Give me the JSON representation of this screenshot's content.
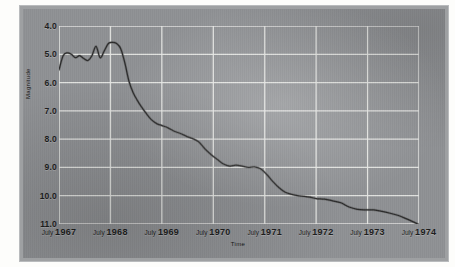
{
  "chart_data": {
    "type": "line",
    "title": "",
    "xlabel": "Time",
    "ylabel": "Magnitude",
    "grid": true,
    "legend": "none",
    "y_inverted": true,
    "ylim": [
      4.0,
      11.0
    ],
    "yticks": [
      "4.0",
      "5.0",
      "6.0",
      "7.0",
      "8.0",
      "9.0",
      "10.0",
      "11.0"
    ],
    "xticks": [
      {
        "month": "July",
        "year": "1967"
      },
      {
        "month": "July",
        "year": "1968"
      },
      {
        "month": "July",
        "year": "1969"
      },
      {
        "month": "July",
        "year": "1970"
      },
      {
        "month": "July",
        "year": "1971"
      },
      {
        "month": "July",
        "year": "1972"
      },
      {
        "month": "July",
        "year": "1973"
      },
      {
        "month": "July",
        "year": "1974"
      }
    ],
    "xlim": [
      1967.5,
      1974.5
    ],
    "series": [
      {
        "name": "Magnitude",
        "color": "#2b2b2b",
        "x": [
          1967.5,
          1967.58,
          1967.66,
          1967.74,
          1967.82,
          1967.9,
          1967.98,
          1968.06,
          1968.14,
          1968.22,
          1968.3,
          1968.38,
          1968.46,
          1968.54,
          1968.62,
          1968.7,
          1968.78,
          1968.86,
          1968.94,
          1969.02,
          1969.1,
          1969.2,
          1969.3,
          1969.4,
          1969.5,
          1969.62,
          1969.74,
          1969.86,
          1969.98,
          1970.1,
          1970.22,
          1970.34,
          1970.46,
          1970.58,
          1970.7,
          1970.82,
          1970.94,
          1971.06,
          1971.18,
          1971.3,
          1971.42,
          1971.54,
          1971.66,
          1971.78,
          1971.9,
          1972.02,
          1972.14,
          1972.26,
          1972.38,
          1972.5,
          1972.66,
          1972.82,
          1972.98,
          1973.14,
          1973.3,
          1973.46,
          1973.62,
          1973.78,
          1973.94,
          1974.1,
          1974.26,
          1974.42,
          1974.5
        ],
        "y": [
          5.55,
          5.05,
          4.95,
          5.0,
          5.12,
          5.05,
          5.15,
          5.22,
          5.05,
          4.72,
          5.12,
          4.88,
          4.62,
          4.58,
          4.62,
          4.8,
          5.3,
          5.95,
          6.35,
          6.62,
          6.85,
          7.1,
          7.32,
          7.45,
          7.52,
          7.6,
          7.72,
          7.8,
          7.9,
          7.98,
          8.1,
          8.35,
          8.55,
          8.72,
          8.88,
          8.95,
          8.92,
          8.95,
          9.0,
          8.98,
          9.05,
          9.25,
          9.5,
          9.72,
          9.88,
          9.95,
          10.0,
          10.02,
          10.05,
          10.1,
          10.12,
          10.18,
          10.25,
          10.4,
          10.48,
          10.5,
          10.5,
          10.55,
          10.62,
          10.7,
          10.82,
          10.95,
          11.02
        ]
      }
    ]
  },
  "axis": {
    "y_title": "Magnitude",
    "x_title": "Time"
  }
}
